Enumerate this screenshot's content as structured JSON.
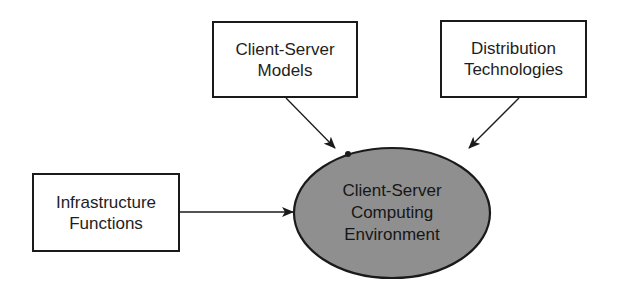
{
  "diagram": {
    "type": "influence-diagram",
    "colors": {
      "stroke": "#1a1a1a",
      "box_fill": "#ffffff",
      "ellipse_fill": "#8f8f8f",
      "text": "#1e1e1e"
    },
    "nodes": [
      {
        "id": "client-server-models",
        "shape": "rectangle",
        "lines": [
          "Client-Server",
          "Models"
        ]
      },
      {
        "id": "distribution-technologies",
        "shape": "rectangle",
        "lines": [
          "Distribution",
          "Technologies"
        ]
      },
      {
        "id": "infrastructure-functions",
        "shape": "rectangle",
        "lines": [
          "Infrastructure",
          "Functions"
        ]
      },
      {
        "id": "computing-environment",
        "shape": "ellipse",
        "lines": [
          "Client-Server",
          "Computing",
          "Environment"
        ]
      }
    ],
    "edges": [
      {
        "from": "client-server-models",
        "to": "computing-environment"
      },
      {
        "from": "distribution-technologies",
        "to": "computing-environment"
      },
      {
        "from": "infrastructure-functions",
        "to": "computing-environment"
      }
    ]
  }
}
